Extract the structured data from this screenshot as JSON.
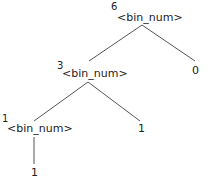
{
  "tree": {
    "root": {
      "value": "6",
      "label": "<bin_num>",
      "left": {
        "value": "3",
        "label": "<bin_num>",
        "left": {
          "value": "1",
          "label": "<bin_num>",
          "child": {
            "value": "1"
          }
        },
        "right": {
          "value": "1"
        }
      },
      "right": {
        "value": "0"
      }
    }
  },
  "colors": {
    "edge": "#555555",
    "text": "#222222",
    "background": "#ffffff"
  }
}
